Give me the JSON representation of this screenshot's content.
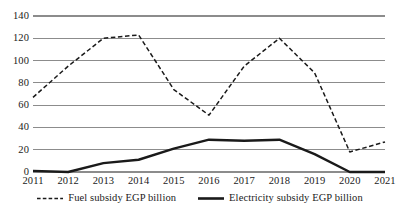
{
  "chart_data": {
    "type": "line",
    "title": "",
    "xlabel": "",
    "ylabel": "",
    "categories": [
      "2011",
      "2012",
      "2013",
      "2014",
      "2015",
      "2016",
      "2017",
      "2018",
      "2019",
      "2020",
      "2021"
    ],
    "ylim": [
      0,
      140
    ],
    "yticks": [
      0,
      20,
      40,
      60,
      80,
      100,
      120,
      140
    ],
    "grid": true,
    "legend_position": "bottom",
    "series": [
      {
        "name": "Fuel subsidy EGP billion",
        "style": "dashed",
        "color": "#1a1a1a",
        "values": [
          67,
          95,
          120,
          123,
          74,
          51,
          95,
          120,
          89,
          18,
          27
        ]
      },
      {
        "name": "Electricity subsidy EGP billion",
        "style": "solid",
        "color": "#1a1a1a",
        "values": [
          1,
          0,
          8,
          11,
          21,
          29,
          28,
          29,
          16,
          0,
          0
        ]
      }
    ]
  },
  "axes": {
    "y_tick_labels": [
      "140",
      "120",
      "100",
      "80",
      "60",
      "40",
      "20",
      "0"
    ],
    "x_tick_labels": [
      "2011",
      "2012",
      "2013",
      "2014",
      "2015",
      "2016",
      "2017",
      "2018",
      "2019",
      "2020",
      "2021"
    ]
  },
  "legend": {
    "items": [
      {
        "label": "Fuel subsidy EGP billion",
        "style": "dashed"
      },
      {
        "label": "Electricity subsidy EGP billion",
        "style": "solid"
      }
    ]
  },
  "colors": {
    "gridline": "#8c8c8c",
    "series": "#1a1a1a",
    "background": "#ffffff"
  }
}
